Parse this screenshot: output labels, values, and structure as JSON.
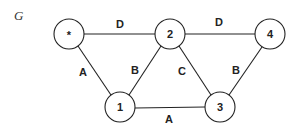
{
  "graph": {
    "name": "G",
    "nodes": [
      {
        "id": "star",
        "label": "*",
        "x": 69,
        "y": 34
      },
      {
        "id": "n2",
        "label": "2",
        "x": 170,
        "y": 34
      },
      {
        "id": "n4",
        "label": "4",
        "x": 270,
        "y": 34
      },
      {
        "id": "n1",
        "label": "1",
        "x": 120,
        "y": 107
      },
      {
        "id": "n3",
        "label": "3",
        "x": 220,
        "y": 107
      }
    ],
    "edges": [
      {
        "from": "star",
        "to": "n2",
        "label": "D",
        "lx": 120,
        "ly": 24
      },
      {
        "from": "n2",
        "to": "n4",
        "label": "D",
        "lx": 219,
        "ly": 22
      },
      {
        "from": "star",
        "to": "n1",
        "label": "A",
        "lx": 83,
        "ly": 72
      },
      {
        "from": "n2",
        "to": "n1",
        "label": "B",
        "lx": 135,
        "ly": 70
      },
      {
        "from": "n2",
        "to": "n3",
        "label": "C",
        "lx": 182,
        "ly": 71
      },
      {
        "from": "n4",
        "to": "n3",
        "label": "B",
        "lx": 236,
        "ly": 70
      },
      {
        "from": "n1",
        "to": "n3",
        "label": "A",
        "lx": 169,
        "ly": 119
      }
    ]
  }
}
